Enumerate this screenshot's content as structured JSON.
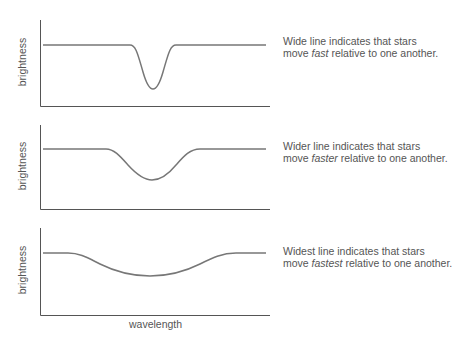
{
  "panels": [
    {
      "ylabel": "brightness",
      "desc_pre": "Wide line indicates that stars",
      "desc_move": "move ",
      "desc_em": "fast",
      "desc_post": " relative to one another."
    },
    {
      "ylabel": "brightness",
      "desc_pre": "Wider line indicates that stars",
      "desc_move": "move ",
      "desc_em": "faster",
      "desc_post": " relative to one another."
    },
    {
      "ylabel": "brightness",
      "desc_pre": "Widest line indicates that stars",
      "desc_move": "move ",
      "desc_em": "fastest",
      "desc_post": " relative to one another."
    }
  ],
  "xlabel": "wavelength",
  "colors": {
    "line": "#777777",
    "axis": "#555555",
    "text": "#555555"
  }
}
